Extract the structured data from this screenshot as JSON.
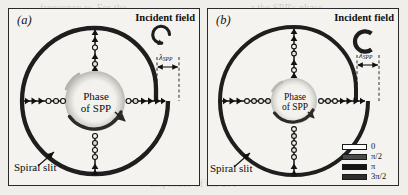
{
  "figure": {
    "background_color": "#efeeea",
    "panel_background": "#f4f3ef",
    "ink_color": "#1a1a1a"
  },
  "panels": [
    {
      "id": "a",
      "label": "(a)",
      "incident_field_label": "Incident field",
      "incident_field_icon": "counterclockwise-circular-arrow",
      "lambda_label": "λ",
      "lambda_subscript": "SPP",
      "center_title_line1": "Phase",
      "center_title_line2": "of SPP",
      "center_arrow_icon": "clockwise-phase-arrow",
      "slit_label": "Spiral slit",
      "slit_leader_icon": "arrow-pointer",
      "geometry": {
        "outer_radius": 73,
        "inner_radius": 30,
        "step_offset": 12,
        "arrow_chain_count": 4
      }
    },
    {
      "id": "b",
      "label": "(b)",
      "incident_field_label": "Incident field",
      "incident_field_icon": "counterclockwise-circular-arrow",
      "lambda_label": "λ",
      "lambda_subscript": "SPP",
      "center_title_line1": "Phase",
      "center_title_line2": "of SPP",
      "center_arrow_icon": "clockwise-phase-arrow",
      "slit_label": "Spiral slit",
      "slit_leader_icon": "arrow-pointer",
      "geometry": {
        "outer_radius": 74,
        "inner_radius": 23,
        "step_offset": 12,
        "arrow_chain_count": 4
      }
    }
  ],
  "legend": {
    "title": "",
    "entries": [
      {
        "label": "0",
        "color": "#ffffff"
      },
      {
        "label": "π/2",
        "color": "#4a4a4a"
      },
      {
        "label": "π",
        "color": "#151515"
      },
      {
        "label": "3π/2",
        "color": "#2e2e2e"
      }
    ]
  },
  "background_text": {
    "lines": [
      "frequency w. For the",
      "of the incident field",
      "the dispersion and",
      "the SPP wave at the",
      "calculated for the",
      "by the spiral slit in",
      "of the SPP wave as",
      "in Fig. 4. The SPPs",
      "a the SPP's phase",
      "the SPP wave is the",
      "is the SPP wave in the",
      "amplitude of the SPP"
    ]
  }
}
